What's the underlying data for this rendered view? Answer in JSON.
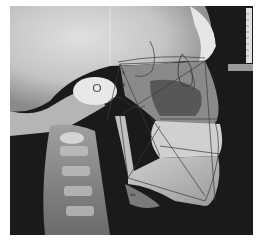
{
  "image": {
    "subject": "Lateral cephalometric radiograph with cephalometric tracing",
    "view": "lateral skull, facing right",
    "colors": {
      "background": "#ffffff",
      "film_dark": "#1a1a1a",
      "bone_light": "#d8d8d8",
      "tracing_line": "#3a3a3a"
    },
    "features": [
      "skull",
      "orbit",
      "maxilla",
      "mandible",
      "teeth",
      "cervical spine",
      "ear rod",
      "measurement ruler",
      "tracing lines"
    ],
    "labels": [
      "S",
      "N",
      "Ar",
      "Go",
      "Me"
    ]
  }
}
